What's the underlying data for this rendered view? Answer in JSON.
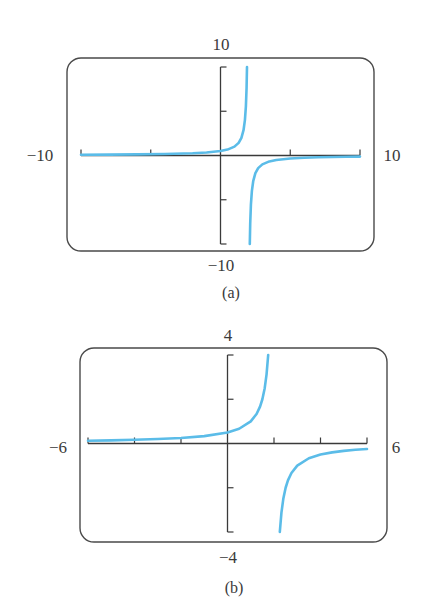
{
  "figure": {
    "curve_color": "#5BBCE8",
    "frame_color": "#4a4a4a",
    "axis_color": "#3a3a3a"
  },
  "chart_data": [
    {
      "type": "line",
      "panel": "(a)",
      "function": "y = 1/(2 - x)",
      "title": "",
      "xlabel": "",
      "ylabel": "",
      "xlim": [
        -10,
        10
      ],
      "ylim": [
        -10,
        10
      ],
      "window_labels": {
        "xmin": "−10",
        "xmax": "10",
        "ymin": "−10",
        "ymax": "10"
      },
      "x_ticks": [
        -10,
        -5,
        0,
        5,
        10
      ],
      "y_ticks": [
        -10,
        -5,
        5,
        10
      ],
      "vertical_asymptote": 2,
      "grid": false,
      "legend": null,
      "caption": "(a)",
      "series": [
        {
          "name": "left branch",
          "x": [
            -10,
            -8,
            -6,
            -4,
            -2,
            -1,
            0,
            0.5,
            1,
            1.3,
            1.5,
            1.65,
            1.75,
            1.82,
            1.87,
            1.9
          ],
          "y": [
            0.083,
            0.1,
            0.125,
            0.167,
            0.25,
            0.333,
            0.5,
            0.667,
            1,
            1.429,
            2,
            2.857,
            4,
            5.556,
            7.692,
            10
          ]
        },
        {
          "name": "right branch",
          "x": [
            2.1,
            2.13,
            2.18,
            2.25,
            2.35,
            2.5,
            2.7,
            3,
            3.5,
            4,
            5,
            6,
            7,
            8,
            9,
            10
          ],
          "y": [
            -10,
            -7.692,
            -5.556,
            -4,
            -2.857,
            -2,
            -1.429,
            -1,
            -0.667,
            -0.5,
            -0.333,
            -0.25,
            -0.2,
            -0.167,
            -0.143,
            -0.125
          ]
        }
      ]
    },
    {
      "type": "line",
      "panel": "(b)",
      "function": "y = 1/(2 - x)",
      "title": "",
      "xlabel": "",
      "ylabel": "",
      "xlim": [
        -6,
        6
      ],
      "ylim": [
        -4,
        4
      ],
      "window_labels": {
        "xmin": "−6",
        "xmax": "6",
        "ymin": "−4",
        "ymax": "4"
      },
      "x_ticks": [
        -6,
        -4,
        -2,
        0,
        2,
        4,
        6
      ],
      "y_ticks": [
        -4,
        -2,
        2,
        4
      ],
      "vertical_asymptote": 2,
      "grid": false,
      "legend": null,
      "caption": "(b)",
      "series": [
        {
          "name": "left branch",
          "x": [
            -6,
            -5,
            -4,
            -3,
            -2,
            -1,
            0,
            0.5,
            1,
            1.25,
            1.4,
            1.5,
            1.6,
            1.68,
            1.75
          ],
          "y": [
            0.125,
            0.143,
            0.167,
            0.2,
            0.25,
            0.333,
            0.5,
            0.667,
            1,
            1.333,
            1.667,
            2,
            2.5,
            3.125,
            4
          ]
        },
        {
          "name": "right branch",
          "x": [
            2.25,
            2.32,
            2.4,
            2.5,
            2.6,
            2.75,
            3,
            3.5,
            4,
            4.5,
            5,
            5.5,
            6
          ],
          "y": [
            -4,
            -3.125,
            -2.5,
            -2,
            -1.667,
            -1.333,
            -1,
            -0.667,
            -0.5,
            -0.4,
            -0.333,
            -0.286,
            -0.25
          ]
        }
      ]
    }
  ],
  "panels": [
    {
      "frame": {
        "x": 67,
        "y": 58,
        "w": 307,
        "h": 193,
        "r": 14
      },
      "plot": {
        "x0": 81,
        "x1": 360,
        "y0": 67,
        "y1": 244
      },
      "labels": {
        "top": {
          "text": "10",
          "x": 221,
          "y": 45
        },
        "bottom": {
          "text": "−10",
          "x": 221,
          "y": 266
        },
        "left": {
          "text": "−10",
          "x": 40,
          "y": 156
        },
        "right": {
          "text": "10",
          "x": 392,
          "y": 156
        },
        "caption": {
          "text": "(a)",
          "x": 231,
          "y": 294
        }
      }
    },
    {
      "frame": {
        "x": 80,
        "y": 348,
        "w": 307,
        "h": 194,
        "r": 14
      },
      "plot": {
        "x0": 88,
        "x1": 367,
        "y0": 355,
        "y1": 532
      },
      "labels": {
        "top": {
          "text": "4",
          "x": 228,
          "y": 336
        },
        "bottom": {
          "text": "−4",
          "x": 228,
          "y": 558
        },
        "left": {
          "text": "−6",
          "x": 58,
          "y": 448
        },
        "right": {
          "text": "6",
          "x": 396,
          "y": 448
        },
        "caption": {
          "text": "(b)",
          "x": 234,
          "y": 589
        }
      }
    }
  ]
}
